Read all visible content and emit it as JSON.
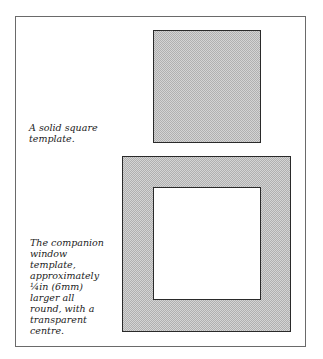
{
  "figure": {
    "solid_caption": [
      "A solid square",
      "template."
    ],
    "window_caption": [
      "The companion",
      "window",
      "template,",
      "approximately",
      "¼in (6mm)",
      "larger all",
      "round, with a",
      "transparent",
      "centre."
    ]
  },
  "colors": {
    "fill_light": "#d4d4d4",
    "fill_dark": "#b0b0b0",
    "border": "#2a2a2a"
  }
}
